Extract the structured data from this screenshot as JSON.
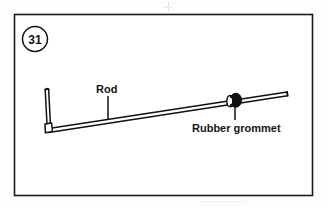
{
  "figure": {
    "step_number": "31",
    "frame": {
      "x": 14,
      "y": 14,
      "width": 299,
      "height": 182,
      "border_color": "#1a1a1a",
      "background_color": "#ffffff"
    },
    "callouts": [
      {
        "id": "rod",
        "label": "Rod",
        "label_x": 96,
        "label_y": 92,
        "leader_x1": 108,
        "leader_y1": 96,
        "leader_x2": 108,
        "leader_y2": 119
      },
      {
        "id": "rubber-grommet",
        "label": "Rubber grommet",
        "label_x": 192,
        "label_y": 132,
        "leader_x1": 235,
        "leader_y1": 106,
        "leader_x2": 235,
        "leader_y2": 120
      }
    ],
    "parts": [
      {
        "id": "rod",
        "name": "Rod",
        "shape": "bent-rod",
        "color": "#111111",
        "bend_top_x": 46,
        "bend_top_y": 89,
        "bend_corner_x": 49,
        "bend_corner_y": 127,
        "end_x": 287,
        "end_y": 93
      },
      {
        "id": "rubber-grommet",
        "name": "Rubber grommet",
        "shape": "grommet",
        "color": "#111111",
        "center_x": 236,
        "center_y": 100,
        "radius_x": 6,
        "radius_y": 7,
        "collar_center_x": 230,
        "collar_center_y": 101,
        "collar_radius_x": 3,
        "collar_radius_y": 5
      }
    ]
  }
}
